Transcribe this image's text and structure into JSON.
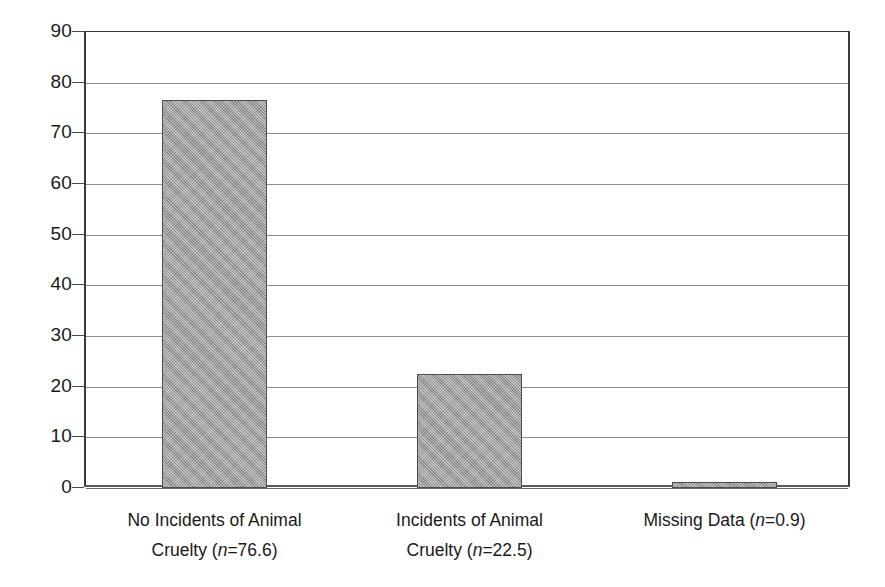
{
  "chart_data": {
    "type": "bar",
    "title": "",
    "subtitle": "",
    "xlabel": "",
    "ylabel": "",
    "categories": [
      "No Incidents of Animal Cruelty (n=76.6)",
      "Incidents of Animal Cruelty (n=22.5)",
      "Missing Data (n=0.9)"
    ],
    "values": [
      76.6,
      22.5,
      0.9
    ],
    "ylim": [
      0,
      90
    ],
    "ytick_values": [
      0,
      10,
      20,
      30,
      40,
      50,
      60,
      70,
      80,
      90
    ],
    "ytick_labels": [
      "0",
      "10",
      "20",
      "30",
      "40",
      "50",
      "60",
      "70",
      "80",
      "90"
    ],
    "grid": "horizontal",
    "legend": "none",
    "bar_fill_color": "#9a9a9a",
    "bar_border_color": "#4d4d4d",
    "axis_color": "#3a3a3a",
    "gridline_color": "#8c8c8c",
    "background_color": "#ffffff"
  },
  "axis": {
    "y": {
      "labels": [
        {
          "text": "90",
          "value": 90
        },
        {
          "text": "80",
          "value": 80
        },
        {
          "text": "70",
          "value": 70
        },
        {
          "text": "60",
          "value": 60
        },
        {
          "text": "50",
          "value": 50
        },
        {
          "text": "40",
          "value": 40
        },
        {
          "text": "30",
          "value": 30
        },
        {
          "text": "20",
          "value": 20
        },
        {
          "text": "10",
          "value": 10
        },
        {
          "text": "0",
          "value": 0
        }
      ]
    }
  },
  "categories": [
    {
      "line1": "No Incidents of Animal",
      "line2_prefix": "Cruelty (",
      "line2_italic": "n",
      "line2_suffix": "=76.6)",
      "value": 76.6
    },
    {
      "line1": "Incidents of Animal",
      "line2_prefix": "Cruelty (",
      "line2_italic": "n",
      "line2_suffix": "=22.5)",
      "value": 22.5
    },
    {
      "line1": "Missing Data (",
      "line2_prefix": "",
      "line2_italic": "n",
      "line2_suffix": "=0.9)",
      "value": 0.9
    }
  ]
}
